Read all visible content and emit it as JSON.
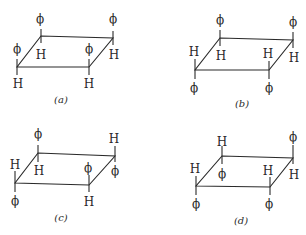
{
  "figure": {
    "symbols": {
      "phenyl": "ϕ",
      "hydrogen": "H"
    },
    "panels": [
      {
        "id": "a",
        "caption": "(a)",
        "corners": {
          "back_left": {
            "up": "ϕ",
            "down": "H"
          },
          "back_right": {
            "up": "ϕ",
            "down": "H"
          },
          "front_left": {
            "up": "ϕ",
            "down": "H"
          },
          "front_right": {
            "up": "ϕ",
            "down": "H"
          }
        }
      },
      {
        "id": "b",
        "caption": "(b)",
        "corners": {
          "back_left": {
            "up": "ϕ",
            "down": "H"
          },
          "back_right": {
            "up": "ϕ",
            "down": "H"
          },
          "front_left": {
            "up": "H",
            "down": "ϕ"
          },
          "front_right": {
            "up": "H",
            "down": "ϕ"
          }
        }
      },
      {
        "id": "c",
        "caption": "(c)",
        "corners": {
          "back_left": {
            "up": "ϕ",
            "down": "H"
          },
          "back_right": {
            "up": "H",
            "down": "ϕ"
          },
          "front_left": {
            "up": "H",
            "down": "ϕ"
          },
          "front_right": {
            "up": "ϕ",
            "down": "H"
          }
        }
      },
      {
        "id": "d",
        "caption": "(d)",
        "corners": {
          "back_left": {
            "up": "H",
            "down": "ϕ"
          },
          "back_right": {
            "up": "ϕ",
            "down": "H"
          },
          "front_left": {
            "up": "H",
            "down": "ϕ"
          },
          "front_right": {
            "up": "H",
            "down": "ϕ"
          }
        }
      }
    ]
  }
}
